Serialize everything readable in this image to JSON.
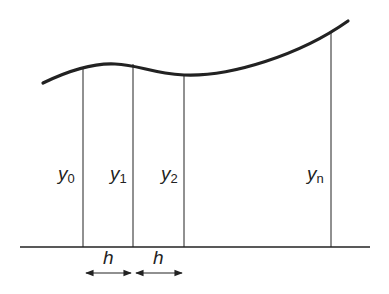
{
  "diagram": {
    "title": "",
    "ordinates": [
      {
        "base": "y",
        "sub": "0",
        "x": 83
      },
      {
        "base": "y",
        "sub": "1",
        "x": 133
      },
      {
        "base": "y",
        "sub": "2",
        "x": 184
      },
      {
        "base": "y",
        "sub": "n",
        "x": 331
      }
    ],
    "spacing_label": "h",
    "spacing_labels": [
      "h",
      "h"
    ],
    "colors": {
      "stroke": "#222222",
      "background": "#ffffff"
    }
  }
}
